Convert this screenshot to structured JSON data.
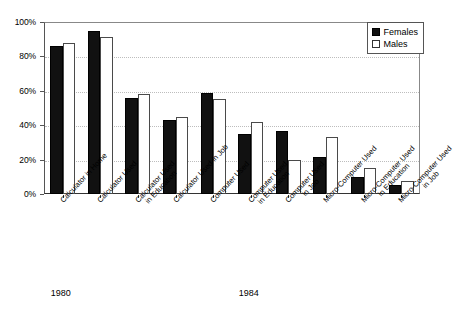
{
  "chart_data": {
    "type": "bar",
    "title": "",
    "xlabel": "",
    "ylabel": "",
    "ylim": [
      0,
      100
    ],
    "yticks": [
      "0%",
      "20%",
      "40%",
      "60%",
      "80%",
      "100%"
    ],
    "ytick_values": [
      0,
      20,
      40,
      60,
      80,
      100
    ],
    "grid": true,
    "legend_position": "top-right",
    "categories": [
      "Calculator in Home",
      "Calculator Used",
      "Calculator Used in Education",
      "Calculator Used in Job",
      "Computer Used",
      "Computer Used in Education",
      "Computer Used in Job",
      "Micro-Computer Used",
      "Micro-Computer Used in Education",
      "Micro-Computer Used in Job"
    ],
    "category_lines": [
      [
        "Calculator in Home"
      ],
      [
        "Calculator Used"
      ],
      [
        "Calculator Used",
        "in Education"
      ],
      [
        "Calculator Used in Job"
      ],
      [
        "Computer Used"
      ],
      [
        "Computer Used",
        "in Education"
      ],
      [
        "Computer Used",
        "in Job"
      ],
      [
        "Micro-Computer Used"
      ],
      [
        "Micro-Computer Used",
        "in Education"
      ],
      [
        "Micro-Computer Used",
        "in Job"
      ]
    ],
    "series": [
      {
        "name": "Females",
        "color": "#111111",
        "values": [
          86,
          95,
          56,
          43,
          59,
          35,
          36.5,
          21.5,
          10,
          5.5
        ]
      },
      {
        "name": "Males",
        "color": "#ffffff",
        "values": [
          88,
          91,
          58,
          44.5,
          55.5,
          42,
          20,
          33,
          15,
          7.5
        ]
      }
    ],
    "period_groups": [
      {
        "label": "1980",
        "categories": [
          "Calculator in Home"
        ]
      },
      {
        "label": "1984",
        "categories": [
          "Calculator Used",
          "Calculator Used in Education",
          "Calculator Used in Job",
          "Computer Used",
          "Computer Used in Education",
          "Computer Used in Job",
          "Micro-Computer Used",
          "Micro-Computer Used in Education",
          "Micro-Computer Used in Job"
        ]
      }
    ]
  },
  "legend": {
    "items": [
      {
        "label": "Females",
        "swatch": "filled-square-icon"
      },
      {
        "label": "Males",
        "swatch": "empty-square-icon"
      }
    ]
  }
}
